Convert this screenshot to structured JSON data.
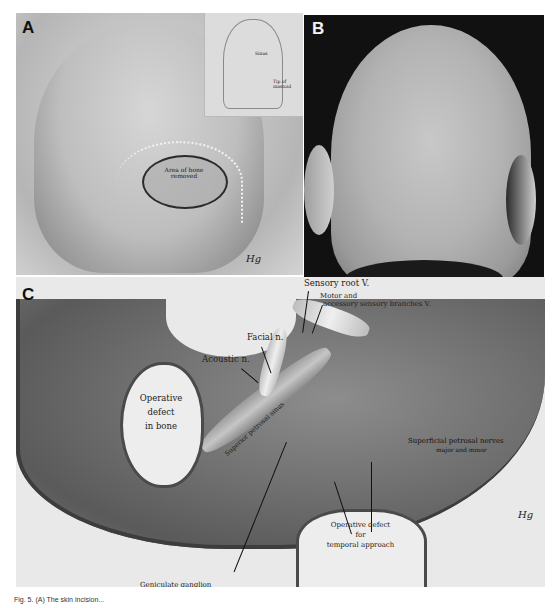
{
  "figure": {
    "panels": [
      {
        "letter": "A",
        "description": "Drawing of posterior skull showing craniectomy",
        "labels": {
          "bone_area": "Area of bone removed",
          "sinus_dotted": "Transverse sinus",
          "inset_sinus": "Sinus",
          "inset_mastoid": "Tip of mastoid"
        },
        "signature": "Hg"
      },
      {
        "letter": "B",
        "description": "Photograph of back of shaved head with incision scar"
      },
      {
        "letter": "C",
        "description": "Drawing of operative exposure of the middle/posterior fossa",
        "labels": {
          "sensory_root": "Sensory root V.",
          "motor_line1": "Motor and",
          "motor_line2": "accessory sensory branches V.",
          "facial": "Facial n.",
          "acoustic": "Acoustic n.",
          "defect_bone_1": "Operative",
          "defect_bone_2": "defect",
          "defect_bone_3": "in bone",
          "superficial_1": "Superficial petrosal nerves",
          "superficial_2": "major and minor",
          "superior_petrosal": "Superior petrosal sinus",
          "temporal_1": "Operative defect",
          "temporal_2": "for",
          "temporal_3": "temporal approach",
          "geniculate": "Geniculate ganglion",
          "transverse_vertical": "Transverse sinus"
        },
        "signature": "Hg"
      }
    ],
    "caption": "Fig. 5. (A) The skin incision..."
  }
}
